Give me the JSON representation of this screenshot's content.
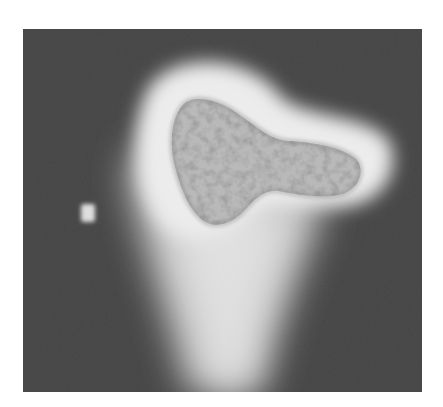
{
  "image": {
    "type": "grayscale micrograph",
    "subject": "cell with bright halo",
    "colors": {
      "background": "#ffffff",
      "field": "#4a4a4a",
      "halo": "#e8e8e8",
      "cell_body": "#b8b8b8",
      "cell_speckle": "#6e6e6e",
      "fleck": "#dcdcdc"
    }
  }
}
